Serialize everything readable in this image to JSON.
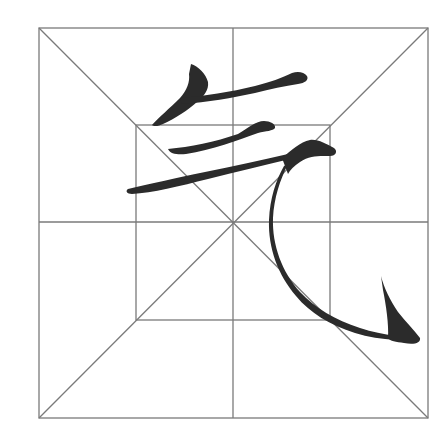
{
  "practice_sheet": {
    "character": "气",
    "grid_type": "米字格 with inner square",
    "colors": {
      "background": "#ffffff",
      "grid": "#7a7a7a",
      "ink": "#2b2b2b"
    },
    "outer_square": {
      "x1": 39,
      "y1": 28,
      "x2": 428,
      "y2": 418
    },
    "inner_square": {
      "x1": 136,
      "y1": 125,
      "x2": 330,
      "y2": 320
    },
    "center": {
      "x": 233,
      "y": 222
    },
    "strokes": [
      "撇",
      "横",
      "横",
      "横折弯钩"
    ]
  }
}
